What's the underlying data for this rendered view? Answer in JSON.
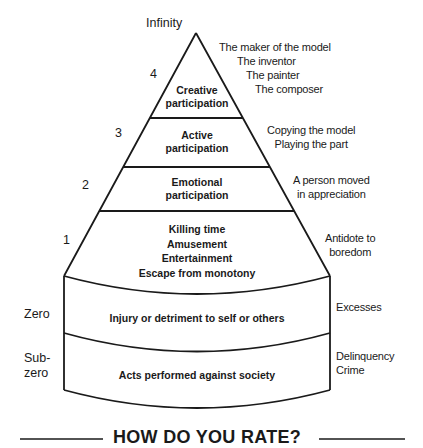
{
  "apex_label": "Infinity",
  "levels": [
    {
      "number": "4",
      "inner": [
        "Creative",
        "participation"
      ],
      "side": [
        "The maker of the model",
        "The inventor",
        "The painter",
        "The composer"
      ]
    },
    {
      "number": "3",
      "inner": [
        "Active",
        "participation"
      ],
      "side": [
        "Copying the model",
        "Playing the part"
      ]
    },
    {
      "number": "2",
      "inner": [
        "Emotional",
        "participation"
      ],
      "side": [
        "A person moved",
        "in appreciation"
      ]
    },
    {
      "number": "1",
      "inner": [
        "Killing time",
        "Amusement",
        "Entertainment",
        "Escape from monotony"
      ],
      "side": [
        "Antidote to",
        "boredom"
      ]
    },
    {
      "number": "Zero",
      "inner": [
        "Injury or detriment to self or others"
      ],
      "side": [
        "Excesses"
      ]
    },
    {
      "number": [
        "Sub-",
        "zero"
      ],
      "inner": [
        "Acts performed against society"
      ],
      "side": [
        "Delinquency",
        "Crime"
      ]
    }
  ],
  "title": "HOW DO YOU RATE?",
  "colors": {
    "ink": "#1a1a1a",
    "background": "#ffffff"
  }
}
